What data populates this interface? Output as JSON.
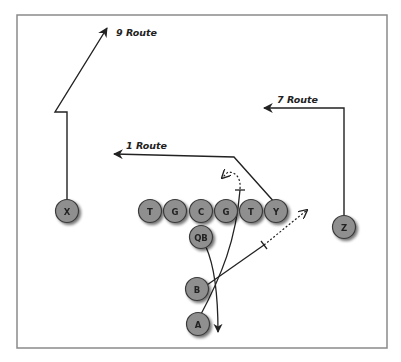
{
  "diagram": {
    "colors": {
      "frame": "#8a8a8a",
      "player_fill": "#8f8f8f",
      "player_stroke": "#3a3a3a",
      "line": "#222222"
    },
    "routes": [
      {
        "id": "9",
        "label": "9 Route",
        "runner": "X"
      },
      {
        "id": "7",
        "label": "7 Route",
        "runner": "Z"
      },
      {
        "id": "1",
        "label": "1 Route",
        "runner": "Y"
      }
    ],
    "players": {
      "X": "X",
      "T1": "T",
      "G1": "G",
      "C": "C",
      "G2": "G",
      "T2": "T",
      "Y": "Y",
      "Z": "Z",
      "QB": "QB",
      "B": "B",
      "A": "A"
    }
  }
}
